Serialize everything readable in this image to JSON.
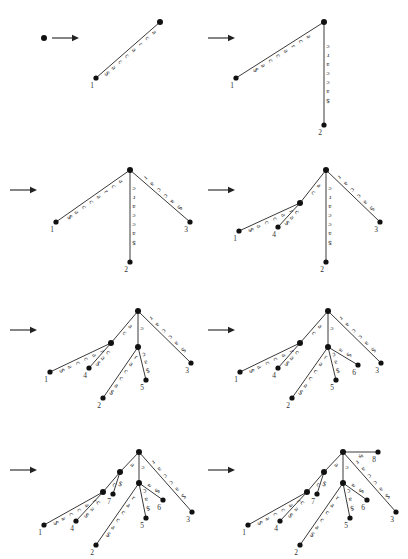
{
  "figure": {
    "title": "",
    "kind": "suffix-tree-construction-sequence",
    "string": "acracca$",
    "alphabet": [
      "a",
      "c",
      "r",
      "$"
    ],
    "terminator": "$",
    "panel_count": 8,
    "arrow_glyph": "arrow-right-icon"
  },
  "chart_data": {
    "type": "diagram",
    "title": "",
    "steps": [
      {
        "index": 1,
        "caption": "",
        "nodes": [
          {
            "id": "root",
            "x": 44,
            "y": 38,
            "kind": "root"
          }
        ],
        "edges": [],
        "leaves": []
      },
      {
        "index": 2,
        "caption": "",
        "nodes": [
          {
            "id": "root",
            "x": 160,
            "y": 22,
            "kind": "root"
          },
          {
            "id": "L1",
            "x": 96,
            "y": 78,
            "kind": "leaf",
            "label": "1"
          }
        ],
        "edges": [
          {
            "from": "root",
            "to": "L1",
            "label": "acracca$"
          }
        ],
        "leaves": [
          "1"
        ]
      },
      {
        "index": 3,
        "caption": "",
        "nodes": [
          {
            "id": "root",
            "x": 324,
            "y": 22,
            "kind": "root"
          },
          {
            "id": "L1",
            "x": 236,
            "y": 78,
            "kind": "leaf",
            "label": "1"
          },
          {
            "id": "L2",
            "x": 324,
            "y": 125,
            "kind": "leaf",
            "label": "2"
          }
        ],
        "edges": [
          {
            "from": "root",
            "to": "L1",
            "label": "acracca$"
          },
          {
            "from": "root",
            "to": "L2",
            "label": "cracca$"
          }
        ],
        "leaves": [
          "1",
          "2"
        ]
      },
      {
        "index": 4,
        "caption": "",
        "nodes": [
          {
            "id": "root",
            "x": 130,
            "y": 170,
            "kind": "root"
          },
          {
            "id": "L1",
            "x": 56,
            "y": 222,
            "kind": "leaf",
            "label": "1"
          },
          {
            "id": "L2",
            "x": 130,
            "y": 262,
            "kind": "leaf",
            "label": "2"
          },
          {
            "id": "L3",
            "x": 190,
            "y": 222,
            "kind": "leaf",
            "label": "3"
          }
        ],
        "edges": [
          {
            "from": "root",
            "to": "L1",
            "label": "acracca$"
          },
          {
            "from": "root",
            "to": "L2",
            "label": "cracca$"
          },
          {
            "from": "root",
            "to": "L3",
            "label": "racca$"
          }
        ],
        "leaves": [
          "1",
          "2",
          "3"
        ]
      },
      {
        "index": 5,
        "caption": "",
        "nodes": [
          {
            "id": "root",
            "x": 326,
            "y": 170,
            "kind": "root"
          },
          {
            "id": "Na",
            "x": 300,
            "y": 203,
            "kind": "internal"
          },
          {
            "id": "L1",
            "x": 239,
            "y": 231,
            "kind": "leaf",
            "label": "1"
          },
          {
            "id": "L4",
            "x": 278,
            "y": 227,
            "kind": "leaf",
            "label": "4"
          },
          {
            "id": "L2",
            "x": 326,
            "y": 262,
            "kind": "leaf",
            "label": "2"
          },
          {
            "id": "L3",
            "x": 380,
            "y": 222,
            "kind": "leaf",
            "label": "3"
          }
        ],
        "edges": [
          {
            "from": "root",
            "to": "Na",
            "label": "ac"
          },
          {
            "from": "Na",
            "to": "L1",
            "label": "racca$"
          },
          {
            "from": "Na",
            "to": "L4",
            "label": "ca$"
          },
          {
            "from": "root",
            "to": "L2",
            "label": "cracca$"
          },
          {
            "from": "root",
            "to": "L3",
            "label": "racca$"
          }
        ],
        "leaves": [
          "1",
          "4",
          "2",
          "3"
        ]
      },
      {
        "index": 6,
        "caption": "",
        "nodes": [
          {
            "id": "root",
            "x": 138,
            "y": 311,
            "kind": "root"
          },
          {
            "id": "Na",
            "x": 111,
            "y": 343,
            "kind": "internal"
          },
          {
            "id": "Nc",
            "x": 138,
            "y": 347,
            "kind": "internal"
          },
          {
            "id": "L1",
            "x": 50,
            "y": 372,
            "kind": "leaf",
            "label": "1"
          },
          {
            "id": "L4",
            "x": 89,
            "y": 368,
            "kind": "leaf",
            "label": "4"
          },
          {
            "id": "L2",
            "x": 103,
            "y": 398,
            "kind": "leaf",
            "label": "2"
          },
          {
            "id": "L5",
            "x": 146,
            "y": 380,
            "kind": "leaf",
            "label": "5"
          },
          {
            "id": "L3",
            "x": 191,
            "y": 363,
            "kind": "leaf",
            "label": "3"
          }
        ],
        "edges": [
          {
            "from": "root",
            "to": "Na",
            "label": "ac"
          },
          {
            "from": "Na",
            "to": "L1",
            "label": "racca$"
          },
          {
            "from": "Na",
            "to": "L4",
            "label": "ca$"
          },
          {
            "from": "root",
            "to": "Nc",
            "label": "c"
          },
          {
            "from": "Nc",
            "to": "L2",
            "label": "racca$"
          },
          {
            "from": "Nc",
            "to": "L5",
            "label": "ca$"
          },
          {
            "from": "root",
            "to": "L3",
            "label": "racca$"
          }
        ],
        "leaves": [
          "1",
          "4",
          "2",
          "5",
          "3"
        ]
      },
      {
        "index": 7,
        "caption": "",
        "nodes": [
          {
            "id": "root",
            "x": 328,
            "y": 311,
            "kind": "root"
          },
          {
            "id": "Na",
            "x": 300,
            "y": 343,
            "kind": "internal"
          },
          {
            "id": "Nc",
            "x": 328,
            "y": 347,
            "kind": "internal"
          },
          {
            "id": "L1",
            "x": 240,
            "y": 372,
            "kind": "leaf",
            "label": "1"
          },
          {
            "id": "L4",
            "x": 278,
            "y": 368,
            "kind": "leaf",
            "label": "4"
          },
          {
            "id": "L2",
            "x": 292,
            "y": 398,
            "kind": "leaf",
            "label": "2"
          },
          {
            "id": "L5",
            "x": 336,
            "y": 380,
            "kind": "leaf",
            "label": "5"
          },
          {
            "id": "L6",
            "x": 358,
            "y": 365,
            "kind": "leaf",
            "label": "6"
          },
          {
            "id": "L3",
            "x": 381,
            "y": 363,
            "kind": "leaf",
            "label": "3"
          }
        ],
        "edges": [
          {
            "from": "root",
            "to": "Na",
            "label": "ac"
          },
          {
            "from": "Na",
            "to": "L1",
            "label": "racca$"
          },
          {
            "from": "Na",
            "to": "L4",
            "label": "ca$"
          },
          {
            "from": "root",
            "to": "Nc",
            "label": "c"
          },
          {
            "from": "Nc",
            "to": "L2",
            "label": "racca$"
          },
          {
            "from": "Nc",
            "to": "L5",
            "label": "ca$"
          },
          {
            "from": "Nc",
            "to": "L6",
            "label": "a$"
          },
          {
            "from": "root",
            "to": "L3",
            "label": "racca$"
          }
        ],
        "leaves": [
          "1",
          "4",
          "2",
          "5",
          "6",
          "3"
        ]
      },
      {
        "index": 8,
        "caption": "",
        "nodes": [
          {
            "id": "root",
            "x": 139,
            "y": 452,
            "kind": "root"
          },
          {
            "id": "Naa",
            "x": 120,
            "y": 472,
            "kind": "internal"
          },
          {
            "id": "Na",
            "x": 103,
            "y": 492,
            "kind": "internal"
          },
          {
            "id": "Nc",
            "x": 139,
            "y": 483,
            "kind": "internal"
          },
          {
            "id": "L1",
            "x": 44,
            "y": 525,
            "kind": "leaf",
            "label": "1"
          },
          {
            "id": "L4",
            "x": 76,
            "y": 521,
            "kind": "leaf",
            "label": "4"
          },
          {
            "id": "L7",
            "x": 113,
            "y": 494,
            "kind": "leaf",
            "label": "7"
          },
          {
            "id": "L2",
            "x": 96,
            "y": 545,
            "kind": "leaf",
            "label": "2"
          },
          {
            "id": "L5",
            "x": 146,
            "y": 518,
            "kind": "leaf",
            "label": "5"
          },
          {
            "id": "L6",
            "x": 163,
            "y": 500,
            "kind": "leaf",
            "label": "6"
          },
          {
            "id": "L3",
            "x": 192,
            "y": 512,
            "kind": "leaf",
            "label": "3"
          }
        ],
        "edges": [
          {
            "from": "root",
            "to": "Naa",
            "label": "a"
          },
          {
            "from": "Naa",
            "to": "Na",
            "label": "c"
          },
          {
            "from": "Na",
            "to": "L1",
            "label": "racca$"
          },
          {
            "from": "Na",
            "to": "L4",
            "label": "ca$"
          },
          {
            "from": "Naa",
            "to": "L7",
            "label": "$"
          },
          {
            "from": "root",
            "to": "Nc",
            "label": "c"
          },
          {
            "from": "Nc",
            "to": "L2",
            "label": "racca$"
          },
          {
            "from": "Nc",
            "to": "L5",
            "label": "ca$"
          },
          {
            "from": "Nc",
            "to": "L6",
            "label": "a$"
          },
          {
            "from": "root",
            "to": "L3",
            "label": "racca$"
          }
        ],
        "leaves": [
          "1",
          "4",
          "7",
          "2",
          "5",
          "6",
          "3"
        ]
      },
      {
        "index": 9,
        "caption": "",
        "nodes": [
          {
            "id": "root",
            "x": 343,
            "y": 452,
            "kind": "root"
          },
          {
            "id": "Naa",
            "x": 324,
            "y": 472,
            "kind": "internal"
          },
          {
            "id": "Na",
            "x": 307,
            "y": 492,
            "kind": "internal"
          },
          {
            "id": "Nc",
            "x": 343,
            "y": 483,
            "kind": "internal"
          },
          {
            "id": "L8",
            "x": 378,
            "y": 452,
            "kind": "leaf",
            "label": "8"
          },
          {
            "id": "L1",
            "x": 248,
            "y": 525,
            "kind": "leaf",
            "label": "1"
          },
          {
            "id": "L4",
            "x": 280,
            "y": 521,
            "kind": "leaf",
            "label": "4"
          },
          {
            "id": "L7",
            "x": 317,
            "y": 494,
            "kind": "leaf",
            "label": "7"
          },
          {
            "id": "L2",
            "x": 300,
            "y": 545,
            "kind": "leaf",
            "label": "2"
          },
          {
            "id": "L5",
            "x": 350,
            "y": 518,
            "kind": "leaf",
            "label": "5"
          },
          {
            "id": "L6",
            "x": 367,
            "y": 500,
            "kind": "leaf",
            "label": "6"
          },
          {
            "id": "L3",
            "x": 396,
            "y": 512,
            "kind": "leaf",
            "label": "3"
          }
        ],
        "edges": [
          {
            "from": "root",
            "to": "Naa",
            "label": "a"
          },
          {
            "from": "Naa",
            "to": "Na",
            "label": "c"
          },
          {
            "from": "Na",
            "to": "L1",
            "label": "racca$"
          },
          {
            "from": "Na",
            "to": "L4",
            "label": "ca$"
          },
          {
            "from": "Naa",
            "to": "L7",
            "label": "$"
          },
          {
            "from": "root",
            "to": "Nc",
            "label": "c"
          },
          {
            "from": "Nc",
            "to": "L2",
            "label": "racca$"
          },
          {
            "from": "Nc",
            "to": "L5",
            "label": "ca$"
          },
          {
            "from": "Nc",
            "to": "L6",
            "label": "a$"
          },
          {
            "from": "root",
            "to": "L3",
            "label": "racca$"
          },
          {
            "from": "root",
            "to": "L8",
            "label": "$"
          }
        ],
        "leaves": [
          "1",
          "4",
          "7",
          "2",
          "5",
          "6",
          "3",
          "8"
        ]
      }
    ],
    "arrows": [
      {
        "index": 1,
        "x": 52,
        "y": 38
      },
      {
        "index": 2,
        "x": 208,
        "y": 38
      },
      {
        "index": 3,
        "x": 10,
        "y": 190
      },
      {
        "index": 4,
        "x": 208,
        "y": 190
      },
      {
        "index": 5,
        "x": 10,
        "y": 330
      },
      {
        "index": 6,
        "x": 208,
        "y": 330
      },
      {
        "index": 7,
        "x": 10,
        "y": 470
      },
      {
        "index": 8,
        "x": 208,
        "y": 470
      }
    ]
  }
}
